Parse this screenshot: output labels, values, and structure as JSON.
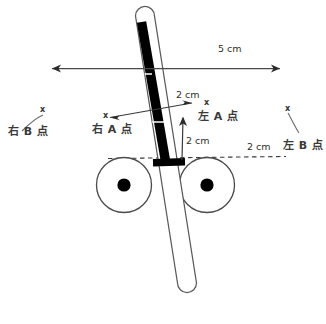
{
  "diagram": {
    "colors": {
      "stroke": "#4a4a4a",
      "fill_black": "#000000",
      "text": "#2e2e2e",
      "background": "#ffffff"
    },
    "dimensions": {
      "width_5cm": "5 cm",
      "offset_2cm_upper": "2 cm",
      "offset_2cm_vertical": "2 cm",
      "offset_2cm_right": "2 cm"
    },
    "points": {
      "right_b": "右 B 点",
      "right_a": "右 A 点",
      "left_a": "左 A 点",
      "left_b": "左 B 点",
      "marker": "x"
    },
    "markers": {
      "right_b_x": "x",
      "right_a_x": "x",
      "left_a_x": "x",
      "left_b_x": "x"
    },
    "parts": {
      "pole": "pole-tube",
      "pole_core": "pole-black-core",
      "base": "pole-base-plate",
      "wheel_left": "left-wheel",
      "wheel_right": "right-wheel",
      "ground": "ground-dashed-line"
    }
  }
}
